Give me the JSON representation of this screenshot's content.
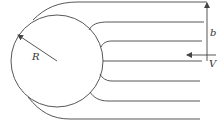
{
  "diagram": {
    "labels": {
      "radius": "R",
      "impact_parameter": "b",
      "velocity": "V"
    },
    "colors": {
      "line": "#444444",
      "text": "#333333",
      "background": "#ffffff"
    },
    "sphere": {
      "cx": 57,
      "cy": 61,
      "r": 46
    },
    "streamline_count": 7
  }
}
